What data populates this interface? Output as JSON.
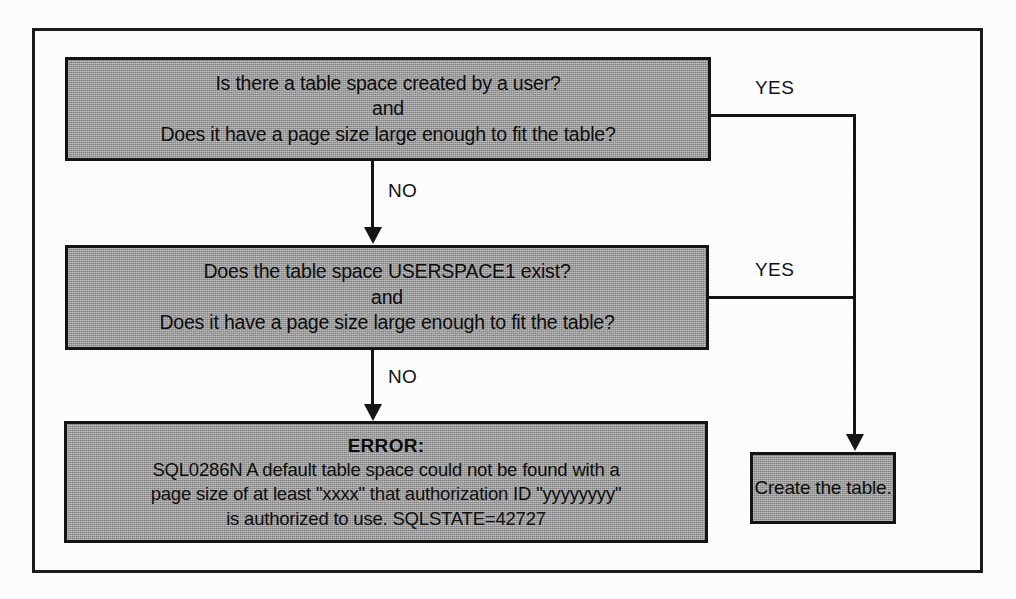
{
  "diagram": {
    "colors": {
      "node_fill": "#9d9d9d",
      "node_border": "#141414",
      "connector": "#151515",
      "frame": "#1b1b1b",
      "background": "#fdfdfd",
      "text": "#0d0d0d"
    },
    "nodes": {
      "question_1": {
        "id": "q1",
        "lines": [
          "Is there a table space created by a user?",
          "and",
          "Does it have a page size large enough to fit the table?"
        ]
      },
      "question_2": {
        "id": "q2",
        "lines": [
          "Does the table space USERSPACE1 exist?",
          "and",
          "Does it have a page size large enough to fit the table?"
        ]
      },
      "error": {
        "id": "error",
        "title": "ERROR:",
        "lines": [
          "SQL0286N  A default table space could not be found with a",
          "page size of at least \"xxxx\" that authorization ID \"yyyyyyyy\"",
          "is authorized to use.  SQLSTATE=42727"
        ]
      },
      "create_table": {
        "id": "create",
        "label": "Create the table."
      }
    },
    "edges": {
      "q1_no": {
        "label": "NO",
        "from": "question_1",
        "to": "question_2"
      },
      "q2_no": {
        "label": "NO",
        "from": "question_2",
        "to": "error"
      },
      "q1_yes": {
        "label": "YES",
        "from": "question_1",
        "to": "create_table"
      },
      "q2_yes": {
        "label": "YES",
        "from": "question_2",
        "to": "create_table"
      }
    }
  }
}
